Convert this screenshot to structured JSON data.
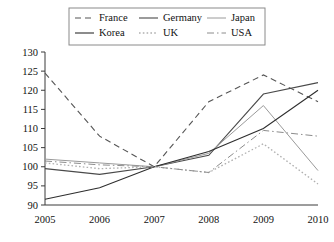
{
  "chart_data": {
    "type": "line",
    "title": "",
    "subtitle": "",
    "xlabel": "",
    "ylabel": "",
    "x": [
      2005,
      2006,
      2007,
      2008,
      2009,
      2010
    ],
    "xtick_labels": [
      "2005",
      "2006",
      "2007",
      "2008",
      "2009",
      "2010"
    ],
    "ytick_labels": [
      "90",
      "95",
      "100",
      "105",
      "110",
      "115",
      "120",
      "125",
      "130"
    ],
    "yticks": [
      90,
      95,
      100,
      105,
      110,
      115,
      120,
      125,
      130
    ],
    "xlim": [
      2005,
      2010
    ],
    "ylim": [
      90,
      130
    ],
    "grid": false,
    "legend_position": "top-center",
    "series": [
      {
        "name": "France",
        "values": [
          124.5,
          108.0,
          100.0,
          117.0,
          124.0,
          117.0
        ],
        "style": "dashed",
        "color": "#555555",
        "width": 1.1
      },
      {
        "name": "Germany",
        "values": [
          99.5,
          98.0,
          100.0,
          103.0,
          119.0,
          122.0
        ],
        "style": "solid",
        "color": "#4a4a4a",
        "width": 1.1
      },
      {
        "name": "Japan",
        "values": [
          102.0,
          101.0,
          100.0,
          103.5,
          116.0,
          99.0
        ],
        "style": "solid",
        "color": "#9a9a9a",
        "width": 1.0
      },
      {
        "name": "Korea",
        "values": [
          91.5,
          94.5,
          100.0,
          104.0,
          110.0,
          120.0
        ],
        "style": "solid",
        "color": "#2e2e2e",
        "width": 1.1
      },
      {
        "name": "UK",
        "values": [
          101.0,
          99.5,
          100.0,
          98.5,
          106.0,
          95.5
        ],
        "style": "dotted",
        "color": "#b0b0b0",
        "width": 1.3
      },
      {
        "name": "USA",
        "values": [
          101.5,
          100.5,
          100.0,
          98.5,
          109.5,
          108.0
        ],
        "style": "dashdot",
        "color": "#8c8c8c",
        "width": 1.0
      }
    ]
  },
  "legend": {
    "entries": [
      {
        "label": "France",
        "style": "dashed",
        "color": "#555555"
      },
      {
        "label": "Germany",
        "style": "solid",
        "color": "#4a4a4a"
      },
      {
        "label": "Japan",
        "style": "solid",
        "color": "#9a9a9a"
      },
      {
        "label": "Korea",
        "style": "solid",
        "color": "#2e2e2e"
      },
      {
        "label": "UK",
        "style": "dotted",
        "color": "#b0b0b0"
      },
      {
        "label": "USA",
        "style": "dashdot",
        "color": "#8c8c8c"
      }
    ]
  }
}
